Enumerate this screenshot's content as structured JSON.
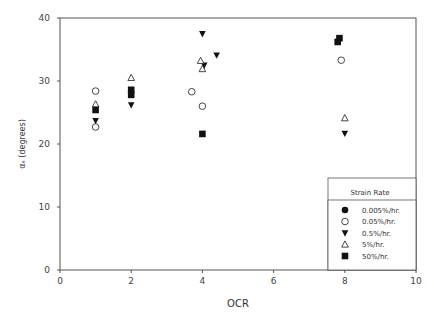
{
  "chart_data": {
    "type": "scatter",
    "title": "",
    "xlabel": "OCR",
    "ylabel": "α_e (degrees)",
    "xlim": [
      0,
      10
    ],
    "ylim": [
      0,
      40
    ],
    "xticks": [
      0,
      2,
      4,
      6,
      8,
      10
    ],
    "yticks": [
      0,
      10,
      20,
      30,
      40
    ],
    "grid": false,
    "legend": {
      "title": "Strain Rate",
      "position": "lower right"
    },
    "series": [
      {
        "name": "0.005%/hr.",
        "marker": "filled-circle",
        "points": []
      },
      {
        "name": "0.05%/hr.",
        "marker": "open-circle",
        "points": [
          [
            1,
            28.4
          ],
          [
            1,
            22.7
          ],
          [
            3.7,
            28.3
          ],
          [
            4,
            26.0
          ],
          [
            7.9,
            33.3
          ]
        ]
      },
      {
        "name": "0.5%/hr.",
        "marker": "filled-triangle-down",
        "points": [
          [
            1,
            23.7
          ],
          [
            2,
            26.2
          ],
          [
            4,
            37.5
          ],
          [
            4.05,
            32.5
          ],
          [
            4.4,
            34.1
          ],
          [
            8,
            21.7
          ]
        ]
      },
      {
        "name": "5%/hr.",
        "marker": "open-triangle-up",
        "points": [
          [
            1,
            26.3
          ],
          [
            2,
            30.5
          ],
          [
            3.95,
            33.2
          ],
          [
            4,
            31.9
          ],
          [
            8,
            24.1
          ]
        ]
      },
      {
        "name": "50%/hr.",
        "marker": "filled-square",
        "points": [
          [
            1,
            25.4
          ],
          [
            2,
            28.6
          ],
          [
            2,
            27.8
          ],
          [
            4,
            21.6
          ],
          [
            7.8,
            36.2
          ],
          [
            7.85,
            36.8
          ]
        ]
      }
    ]
  }
}
